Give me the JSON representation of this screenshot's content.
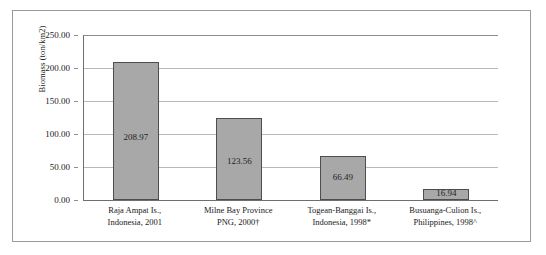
{
  "chart_data": {
    "type": "bar",
    "title": "",
    "xlabel": "",
    "ylabel": "Biomass (ton/km2)",
    "ylim": [
      0,
      250
    ],
    "yticks": [
      "0.00",
      "50.00",
      "100.00",
      "150.00",
      "200.00",
      "250.00"
    ],
    "ytick_values": [
      0,
      50,
      100,
      150,
      200,
      250
    ],
    "grid": true,
    "legend": "none",
    "categories": [
      "Raja Ampat Is., Indonesia, 2001",
      "Milne Bay Province PNG, 2000†",
      "Togean-Banggai Is., Indonesia, 1998*",
      "Busuanga-Culion Is., Philippines, 1998^"
    ],
    "category_lines": [
      [
        "Raja Ampat Is.,",
        "Indonesia, 2001"
      ],
      [
        "Milne Bay Province",
        "PNG, 2000†"
      ],
      [
        "Togean-Banggai Is.,",
        "Indonesia, 1998*"
      ],
      [
        "Busuanga-Culion Is.,",
        "Philippines, 1998^"
      ]
    ],
    "values": [
      208.97,
      123.56,
      66.49,
      16.94
    ],
    "value_labels": [
      "208.97",
      "123.56",
      "66.49",
      "16.94"
    ],
    "bar_color": "#a8a8a8",
    "bar_edge_color": "#4d4d4d",
    "axis_color": "#6e6e6e",
    "gridline_color": "#b8b8b8",
    "text_color": "#1a1a1a",
    "background_color": "#ffffff"
  }
}
